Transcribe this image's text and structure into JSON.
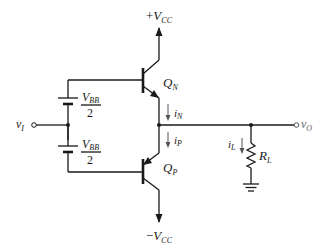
{
  "diagram": {
    "supplies": {
      "positive": {
        "sign": "+",
        "symbol": "V",
        "sub": "CC"
      },
      "negative": {
        "sign": "−",
        "symbol": "V",
        "sub": "CC"
      }
    },
    "transistors": [
      {
        "id": "QN",
        "symbol": "Q",
        "sub": "N",
        "type": "npn"
      },
      {
        "id": "QP",
        "symbol": "Q",
        "sub": "P",
        "type": "pnp"
      }
    ],
    "batteries": [
      {
        "id": "top",
        "numerator_symbol": "V",
        "numerator_sub": "BB",
        "denominator": "2"
      },
      {
        "id": "bottom",
        "numerator_symbol": "V",
        "numerator_sub": "BB",
        "denominator": "2"
      }
    ],
    "currents": [
      {
        "id": "iN",
        "symbol": "i",
        "sub": "N"
      },
      {
        "id": "iP",
        "symbol": "i",
        "sub": "P"
      },
      {
        "id": "iL",
        "symbol": "i",
        "sub": "L"
      }
    ],
    "input": {
      "symbol": "v",
      "sub": "I"
    },
    "output": {
      "symbol": "v",
      "sub": "O"
    },
    "load": {
      "symbol": "R",
      "sub": "L"
    }
  }
}
